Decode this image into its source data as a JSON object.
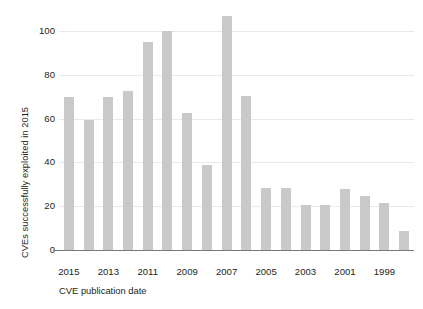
{
  "chart_data": {
    "type": "bar",
    "title": "",
    "xlabel": "CVE publication date",
    "ylabel": "CVEs successfully exploited in 2015",
    "categories": [
      "2015",
      "2014",
      "2013",
      "2012",
      "2011",
      "2010",
      "2009",
      "2008",
      "2007",
      "2006",
      "2005",
      "2004",
      "2003",
      "2002",
      "2001",
      "2000",
      "1999",
      "1998"
    ],
    "values": [
      70,
      59.5,
      70,
      72.5,
      95,
      100,
      62.5,
      39,
      107,
      70.5,
      28.5,
      28.5,
      20.5,
      20.5,
      28,
      24.5,
      21.5,
      8.5
    ],
    "xtick_labels": [
      "2015",
      "2013",
      "2011",
      "2009",
      "2007",
      "2005",
      "2003",
      "2001",
      "1999"
    ],
    "xtick_categories": [
      "2015",
      "2013",
      "2011",
      "2009",
      "2007",
      "2005",
      "2003",
      "2001",
      "1999"
    ],
    "ytick_labels": [
      "0",
      "20",
      "40",
      "60",
      "80",
      "100"
    ],
    "ytick_values": [
      0,
      20,
      40,
      60,
      80,
      100
    ],
    "ylim": [
      0,
      112
    ],
    "grid": "horizontal",
    "legend": "none",
    "bar_color": "#c9c9c9",
    "grid_color": "#e9e9e9",
    "axis_color": "#7a7a7a",
    "text_color": "#231f20"
  }
}
